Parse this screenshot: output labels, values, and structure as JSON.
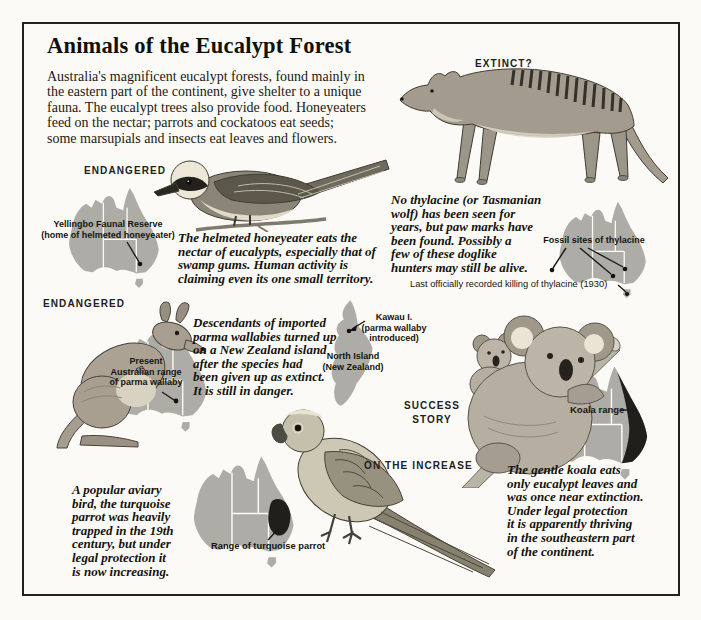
{
  "page": {
    "title": "Animals of the Eucalypt Forest",
    "intro": "Australia's magnificent eucalypt forests, found mainly in\nthe eastern part of the continent, give shelter to a unique\nfauna. The eucalypt trees also provide food. Honeyeaters\nfeed on the nectar; parrots and cockatoos eat seeds;\nsome marsupials and insects eat leaves and flowers."
  },
  "colors": {
    "paper": "#fbfaf6",
    "ink": "#17150f",
    "map_gray": "#aeaca7",
    "range_dark": "#211f19"
  },
  "sections": {
    "honeyeater": {
      "status": "ENDANGERED",
      "map_label": "Yellingbo Faunal Reserve\n(home of helmeted honeyeater)",
      "caption": "The helmeted honeyeater eats the\nnectar of eucalypts, especially that of\nswamp gums. Human activity is\nclaiming even its one small territory."
    },
    "thylacine": {
      "status": "EXTINCT?",
      "caption": "No thylacine (or Tasmanian\nwolf) has been seen for\nyears, but paw marks have\nbeen found. Possibly a\nfew of these doglike\nhunters may still be alive.",
      "map_label": "Fossil sites of thylacine",
      "map_note": "Last officially recorded killing of thylacine (1930)"
    },
    "wallaby": {
      "status": "ENDANGERED",
      "map_label": "Present\nAustralian range\nof parma wallaby",
      "caption": "Descendants of imported\nparma wallabies turned up\non a New Zealand island\nafter the species had\nbeen given up as extinct.\nIt is still in danger.",
      "nz_island_label": "Kawau I.\n(parma wallaby\nintroduced)",
      "nz_region_label": "North Island\n(New Zealand)"
    },
    "parrot": {
      "status": "ON THE INCREASE",
      "caption": "A popular aviary\nbird, the turquoise\nparrot was heavily\ntrapped in the 19th\ncentury, but under\nlegal protection it\nis now increasing.",
      "map_label": "Range of turquoise parrot"
    },
    "koala": {
      "status": "SUCCESS\nSTORY",
      "caption": "The gentle koala eats\nonly eucalypt leaves and\nwas once near extinction.\nUnder legal protection\nit is apparently thriving\nin the southeastern part\nof the continent.",
      "map_label": "Koala range"
    }
  }
}
